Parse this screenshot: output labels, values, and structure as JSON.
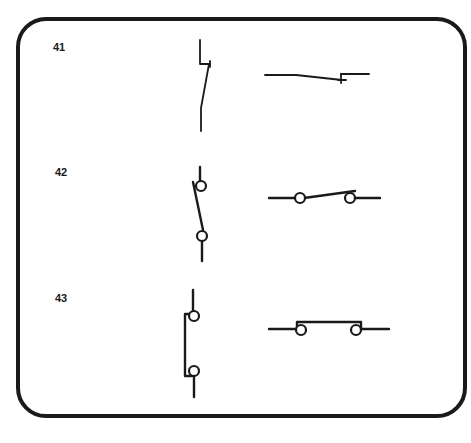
{
  "diagram": {
    "colors": {
      "ink": "#1a1a1a",
      "background": "#ffffff"
    },
    "rows": [
      {
        "label": "41",
        "description": "Normally closed contact (simple)",
        "symbols": [
          "vertical-nc-contact",
          "horizontal-nc-contact"
        ]
      },
      {
        "label": "42",
        "description": "Open contact with terminals (circles)",
        "symbols": [
          "vertical-open-contact-with-terminals",
          "horizontal-open-contact-with-terminals"
        ]
      },
      {
        "label": "43",
        "description": "Closed/bridged contact with terminals (circles)",
        "symbols": [
          "vertical-bridged-contact-with-terminals",
          "horizontal-bridged-contact-with-terminals"
        ]
      }
    ]
  }
}
